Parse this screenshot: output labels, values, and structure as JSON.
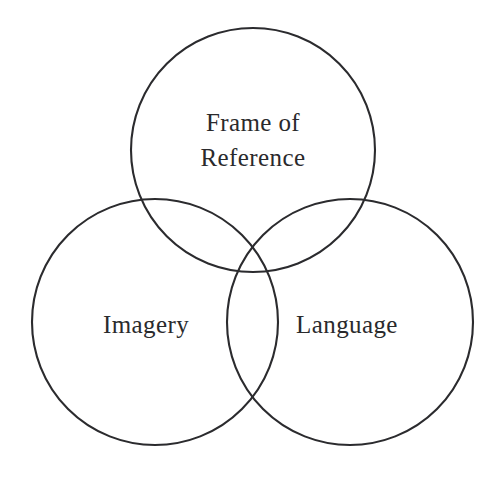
{
  "diagram": {
    "type": "venn-3-circle",
    "title": "",
    "background_color": "#ffffff",
    "stroke_color": "#2b2b2e",
    "stroke_width": 2.1,
    "text_color": "#2a2a2c",
    "font_size": 25,
    "canvas": {
      "width": 502,
      "height": 497
    },
    "sets": [
      {
        "id": "frame-of-reference",
        "label_lines": [
          "Frame of",
          "Reference"
        ],
        "label_line_1": "Frame of",
        "label_line_2": "Reference",
        "cx": 253,
        "cy": 150,
        "r": 122,
        "label_x": 253,
        "label_y_1": 131,
        "label_y_2": 166
      },
      {
        "id": "imagery",
        "label_lines": [
          "Imagery"
        ],
        "label_line_1": "Imagery",
        "cx": 155,
        "cy": 322,
        "r": 123,
        "label_x": 146,
        "label_y_1": 333
      },
      {
        "id": "language",
        "label_lines": [
          "Language"
        ],
        "label_line_1": "Language",
        "cx": 350,
        "cy": 322,
        "r": 123,
        "label_x": 347,
        "label_y_1": 333
      }
    ]
  }
}
